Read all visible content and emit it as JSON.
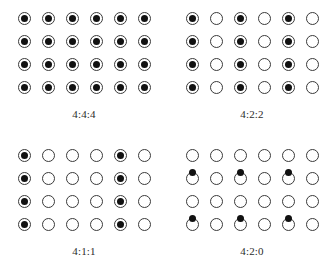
{
  "figure": {
    "background_color": "#ffffff",
    "luma_circle_color": "#3a3a3a",
    "chroma_dot_color": "#111111",
    "grid": {
      "columns": 6,
      "rows": 4,
      "col_spacing_px": 24,
      "row_spacing_px": 23
    }
  },
  "panels": [
    {
      "id": "panel-444",
      "label": "4:4:4",
      "chroma_columns": [
        0,
        1,
        2,
        3,
        4,
        5
      ],
      "chroma_rows": [
        0,
        1,
        2,
        3
      ],
      "chroma_placement": "co-sited",
      "luma_samples": 24,
      "chroma_samples": 24
    },
    {
      "id": "panel-422",
      "label": "4:2:2",
      "chroma_columns": [
        0,
        2,
        4
      ],
      "chroma_rows": [
        0,
        1,
        2,
        3
      ],
      "chroma_placement": "co-sited",
      "luma_samples": 24,
      "chroma_samples": 12
    },
    {
      "id": "panel-411",
      "label": "4:1:1",
      "chroma_columns": [
        0,
        4
      ],
      "chroma_rows": [
        0,
        1,
        2,
        3
      ],
      "chroma_placement": "co-sited",
      "luma_samples": 24,
      "chroma_samples": 8
    },
    {
      "id": "panel-420",
      "label": "4:2:0",
      "chroma_columns": [
        0,
        2,
        4
      ],
      "chroma_row_gaps": [
        0,
        2
      ],
      "chroma_placement": "interstitial",
      "luma_samples": 24,
      "chroma_samples": 6
    }
  ]
}
